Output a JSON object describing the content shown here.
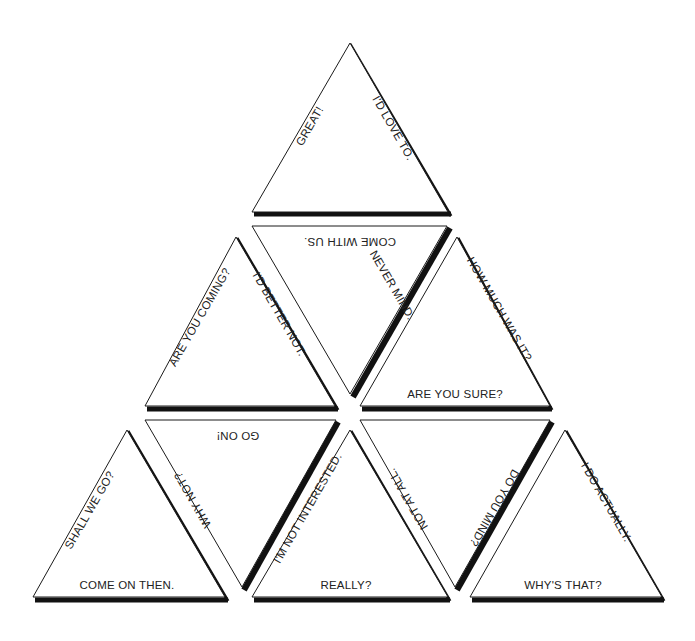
{
  "colors": {
    "background": "#ffffff",
    "line": "#1a1a1a",
    "shadow": "#111111",
    "text": "#222222"
  },
  "triangles": [
    {
      "id": "t1",
      "orientation": "up",
      "left": "GREAT!",
      "right": "I'D LOVE TO.",
      "base": ""
    },
    {
      "id": "t2",
      "orientation": "down",
      "top": "COME WITH US.",
      "left": "",
      "right": "NEVER MIND."
    },
    {
      "id": "t3",
      "orientation": "up",
      "left": "ARE YOU COMING?",
      "right": "I'D BETTER NOT.",
      "base": ""
    },
    {
      "id": "t4",
      "orientation": "up",
      "left": "",
      "right": "HOW MUCH WAS IT?",
      "base": "ARE YOU SURE?"
    },
    {
      "id": "t5",
      "orientation": "up",
      "left": "SHALL WE GO?",
      "right": "",
      "base": "COME ON THEN."
    },
    {
      "id": "t6",
      "orientation": "down",
      "top": "GO ON!",
      "left": "WHY NOT?",
      "right": ""
    },
    {
      "id": "t7",
      "orientation": "up",
      "left": "I'M NOT INTERESTED.",
      "right": "",
      "base": "REALLY?"
    },
    {
      "id": "t8",
      "orientation": "down",
      "top": "",
      "left": "NOT AT ALL.",
      "right": "DO YOU MIND?"
    },
    {
      "id": "t9",
      "orientation": "up",
      "left": "",
      "right": "I DO ACTUALLY.",
      "base": "WHY'S THAT?"
    }
  ]
}
